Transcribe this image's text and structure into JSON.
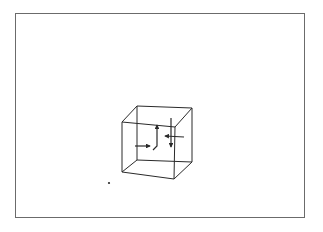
{
  "figure": {
    "frame_color": "#6b6b6b",
    "line_color": "#2a2a2a",
    "background": "#ffffff"
  },
  "cube": {
    "vertices": {
      "back_top_left": [
        137,
        106
      ],
      "back_top_right": [
        192,
        108
      ],
      "back_bottom_left": [
        137,
        160
      ],
      "back_bottom_right": [
        192,
        162
      ],
      "front_top_left": [
        122,
        122
      ],
      "front_top_right": [
        175,
        127
      ],
      "front_bottom_left": [
        122,
        172
      ],
      "front_bottom_right": [
        174,
        179
      ]
    }
  },
  "arrows": [
    {
      "name": "left-horizontal-arrow",
      "from": [
        136,
        146
      ],
      "to": [
        150,
        146
      ],
      "direction": "right"
    },
    {
      "name": "center-up-arrow",
      "from": [
        158,
        143
      ],
      "to": [
        158,
        124
      ],
      "direction": "up"
    },
    {
      "name": "right-down-arrow",
      "from": [
        171,
        120
      ],
      "to": [
        171,
        145
      ],
      "direction": "down"
    },
    {
      "name": "right-horizontal-arrow",
      "from": [
        181,
        137
      ],
      "to": [
        165,
        137
      ],
      "direction": "left"
    }
  ],
  "dot": {
    "position": [
      109,
      183
    ]
  }
}
